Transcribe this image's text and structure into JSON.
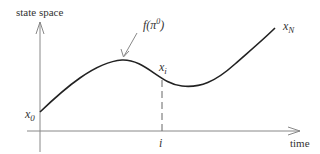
{
  "diagram": {
    "y_axis_label": "state space",
    "x_axis_label": "time",
    "curve_label": {
      "base": "f",
      "open": "(",
      "symbol": "π",
      "sup": "0",
      "close": ")"
    },
    "point_start": {
      "base": "x",
      "sub": "0"
    },
    "point_i": {
      "base": "x",
      "sub": "i"
    },
    "point_end": {
      "base": "x",
      "sub": "N"
    },
    "x_tick_label": "i"
  },
  "colors": {
    "curve": "#222222",
    "axes": "#888888",
    "text": "#333333"
  }
}
